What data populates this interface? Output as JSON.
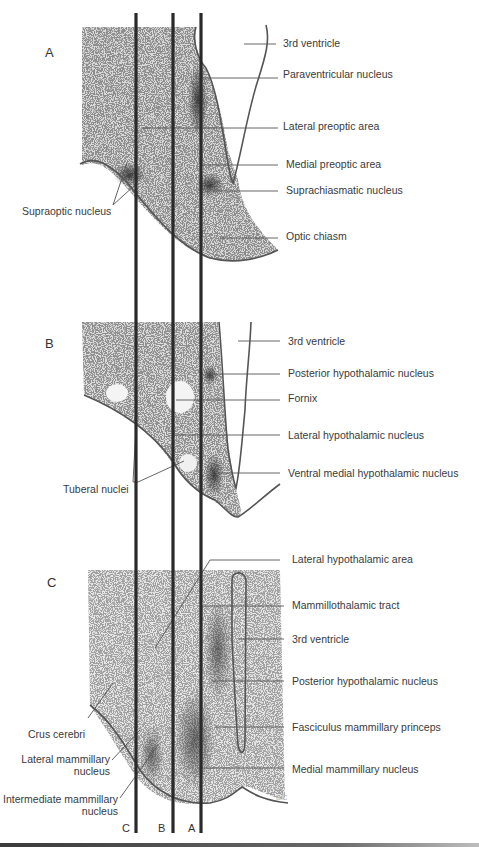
{
  "figure": {
    "panels": [
      {
        "id": "A",
        "letter": "A",
        "labels": [
          {
            "text": "3rd ventricle",
            "x": 283,
            "y": 47
          },
          {
            "text": "Paraventricular nucleus",
            "x": 283,
            "y": 78
          },
          {
            "text": "Lateral preoptic area",
            "x": 283,
            "y": 130
          },
          {
            "text": "Medial preoptic area",
            "x": 286,
            "y": 168
          },
          {
            "text": "Suprachiasmatic nucleus",
            "x": 286,
            "y": 194
          },
          {
            "text": "Optic chiasm",
            "x": 286,
            "y": 240
          }
        ],
        "left_labels": [
          {
            "text": "Supraoptic nucleus",
            "x": 22,
            "y": 215
          }
        ]
      },
      {
        "id": "B",
        "letter": "B",
        "labels": [
          {
            "text": "3rd ventricle",
            "x": 288,
            "y": 345
          },
          {
            "text": "Posterior hypothalamic nucleus",
            "x": 288,
            "y": 377
          },
          {
            "text": "Fornix",
            "x": 288,
            "y": 402
          },
          {
            "text": "Lateral hypothalamic nucleus",
            "x": 288,
            "y": 439
          },
          {
            "text": "Ventral medial hypothalamic nucleus",
            "x": 288,
            "y": 477
          }
        ],
        "left_labels": [
          {
            "text": "Tuberal nuclei",
            "x": 63,
            "y": 493
          }
        ]
      },
      {
        "id": "C",
        "letter": "C",
        "labels": [
          {
            "text": "Lateral hypothalamic area",
            "x": 292,
            "y": 563
          },
          {
            "text": "Mammillothalamic tract",
            "x": 292,
            "y": 609
          },
          {
            "text": "3rd ventricle",
            "x": 292,
            "y": 643
          },
          {
            "text": "Posterior hypothalamic nucleus",
            "x": 292,
            "y": 685
          },
          {
            "text": "Fasciculus mammillary princeps",
            "x": 292,
            "y": 731
          },
          {
            "text": "Medial mammillary nucleus",
            "x": 292,
            "y": 773
          }
        ],
        "left_labels": [
          {
            "text": "Crus cerebri",
            "x": 28,
            "y": 738
          },
          {
            "text": "Lateral mammillary",
            "x": 110,
            "y": 763,
            "anchor": "end"
          },
          {
            "text": "nucleus",
            "x": 110,
            "y": 775,
            "anchor": "end"
          },
          {
            "text": "Intermediate mammillary",
            "x": 118,
            "y": 803,
            "anchor": "end"
          },
          {
            "text": "nucleus",
            "x": 118,
            "y": 815,
            "anchor": "end"
          }
        ]
      }
    ],
    "cut_lines": [
      {
        "letter": "C",
        "x": 136
      },
      {
        "letter": "B",
        "x": 173
      },
      {
        "letter": "A",
        "x": 201
      }
    ],
    "signature": "B/C"
  }
}
